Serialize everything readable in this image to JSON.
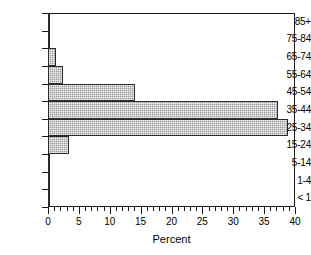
{
  "chart_data": {
    "type": "bar",
    "orientation": "horizontal",
    "title": "",
    "xlabel": "Percent",
    "ylabel": "",
    "xlim": [
      0,
      40
    ],
    "ylim": null,
    "grid": false,
    "legend": null,
    "x_major_ticks": [
      0,
      5,
      10,
      15,
      20,
      25,
      30,
      35,
      40
    ],
    "x_minor_tick_interval": 1,
    "x_tick_labels": [
      "0",
      "5",
      "10",
      "15",
      "20",
      "25",
      "30",
      "35",
      "40"
    ],
    "categories": [
      "85+",
      "75-84",
      "65-74",
      "55-64",
      "45-54",
      "35-44",
      "25-34",
      "15-24",
      "5-14",
      "1-4",
      "< 1"
    ],
    "values": [
      0.1,
      0.4,
      1.3,
      2.5,
      14.1,
      37.3,
      38.8,
      3.4,
      0.3,
      0.2,
      0.4
    ],
    "bar_fill_color": "#9a9a9a",
    "bar_edge_color": "#2b2b2b",
    "axis_color": "#1a1a1a",
    "background_color": "#ffffff"
  }
}
